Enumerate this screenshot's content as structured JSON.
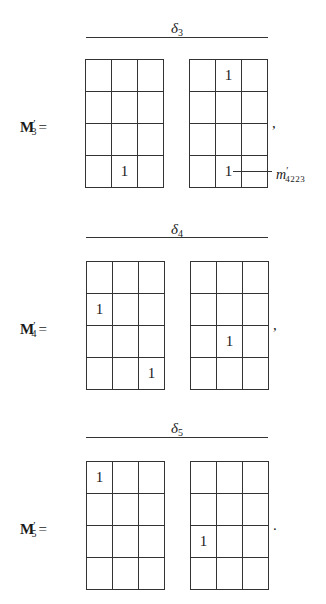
{
  "figure": {
    "sections": [
      {
        "id": "delta3",
        "delta_symbol": "δ",
        "delta_index": "3",
        "matrix_name": "M",
        "matrix_prime": "′",
        "matrix_index": "3",
        "equals": "=",
        "trailing_punct": ",",
        "left_grid": [
          [
            "",
            "",
            ""
          ],
          [
            "",
            "",
            ""
          ],
          [
            "",
            "",
            ""
          ],
          [
            "",
            "1",
            ""
          ]
        ],
        "right_grid": [
          [
            "",
            "1",
            ""
          ],
          [
            "",
            "",
            ""
          ],
          [
            "",
            "",
            ""
          ],
          [
            "",
            "1",
            ""
          ]
        ],
        "annotation": {
          "symbol": "m",
          "prime": "′",
          "subscript": "4223",
          "points_to": "right_grid row 4 col 2"
        }
      },
      {
        "id": "delta4",
        "delta_symbol": "δ",
        "delta_index": "4",
        "matrix_name": "M",
        "matrix_prime": "′",
        "matrix_index": "4",
        "equals": "=",
        "trailing_punct": ",",
        "left_grid": [
          [
            "",
            "",
            ""
          ],
          [
            "1",
            "",
            ""
          ],
          [
            "",
            "",
            ""
          ],
          [
            "",
            "",
            "1"
          ]
        ],
        "right_grid": [
          [
            "",
            "",
            ""
          ],
          [
            "",
            "",
            ""
          ],
          [
            "",
            "1",
            ""
          ],
          [
            "",
            "",
            ""
          ]
        ]
      },
      {
        "id": "delta5",
        "delta_symbol": "δ",
        "delta_index": "5",
        "matrix_name": "M",
        "matrix_prime": "′",
        "matrix_index": "5",
        "equals": "=",
        "trailing_punct": ".",
        "left_grid": [
          [
            "1",
            "",
            ""
          ],
          [
            "",
            "",
            ""
          ],
          [
            "",
            "",
            ""
          ],
          [
            "",
            "",
            ""
          ]
        ],
        "right_grid": [
          [
            "",
            "",
            ""
          ],
          [
            "",
            "",
            ""
          ],
          [
            "1",
            "",
            ""
          ],
          [
            "",
            "",
            ""
          ]
        ]
      }
    ]
  }
}
